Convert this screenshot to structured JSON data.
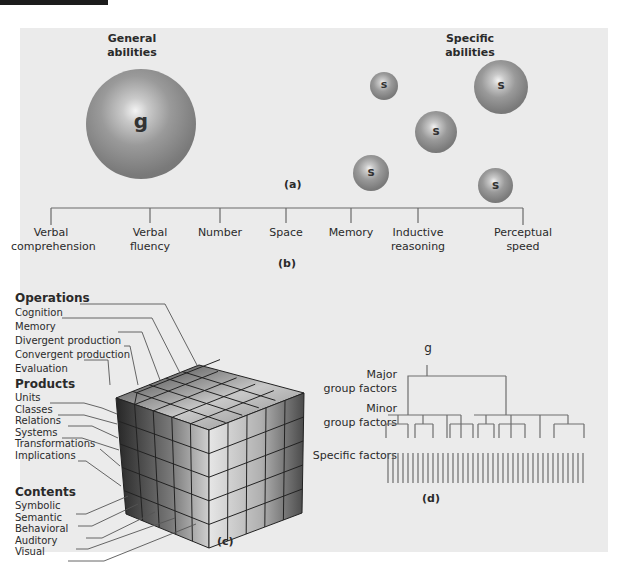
{
  "figure": {
    "panel_a": {
      "caption": "(a)",
      "general_label_line1": "General",
      "general_label_line2": "abilities",
      "general_sphere_letter": "g",
      "specific_label_line1": "Specific",
      "specific_label_line2": "abilities",
      "specific_sphere_letter": "s"
    },
    "panel_b": {
      "caption": "(b)",
      "factors": [
        {
          "line1": "Verbal",
          "line2": "comprehension"
        },
        {
          "line1": "Verbal",
          "line2": "fluency"
        },
        {
          "line1": "Number",
          "line2": ""
        },
        {
          "line1": "Space",
          "line2": ""
        },
        {
          "line1": "Memory",
          "line2": ""
        },
        {
          "line1": "Inductive",
          "line2": "reasoning"
        },
        {
          "line1": "Perceptual",
          "line2": "speed"
        }
      ]
    },
    "panel_c": {
      "caption": "(c)",
      "operations_title": "Operations",
      "operations": [
        "Cognition",
        "Memory",
        "Divergent production",
        "Convergent production",
        "Evaluation"
      ],
      "products_title": "Products",
      "products": [
        "Units",
        "Classes",
        "Relations",
        "Systems",
        "Transformations",
        "Implications"
      ],
      "contents_title": "Contents",
      "contents": [
        "Symbolic",
        "Semantic",
        "Behavioral",
        "Auditory",
        "Visual"
      ]
    },
    "panel_d": {
      "caption": "(d)",
      "root_label": "g",
      "major_label_line1": "Major",
      "major_label_line2": "group factors",
      "minor_label_line1": "Minor",
      "minor_label_line2": "group factors",
      "specific_label": "Specific factors",
      "specific_factor_count": 40
    }
  }
}
